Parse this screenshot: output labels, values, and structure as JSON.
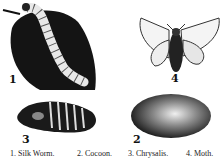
{
  "figures": [
    {
      "id": 1,
      "number": "1",
      "name": "silk-worm"
    },
    {
      "id": 2,
      "number": "2",
      "name": "cocoon"
    },
    {
      "id": 3,
      "number": "3",
      "name": "chrysalis"
    },
    {
      "id": 4,
      "number": "4",
      "name": "moth"
    }
  ],
  "captions": [
    "1. Silk Worm.",
    "2. Cocoon.",
    "3. Chrysalis.",
    "4. Moth."
  ],
  "colors": {
    "ink": "#111111",
    "paper": "#ffffff"
  }
}
